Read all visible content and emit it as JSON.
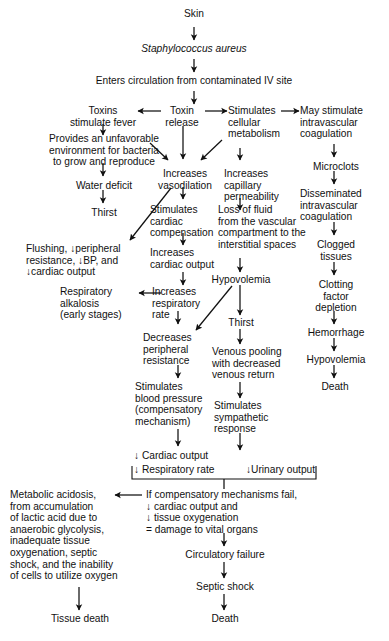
{
  "diagram": {
    "ink_color": "#111111",
    "background_color": "#ffffff",
    "nodes": [
      {
        "id": "skin",
        "text": "Skin"
      },
      {
        "id": "staph",
        "text": "Staphylococcus aureus"
      },
      {
        "id": "enters",
        "text": "Enters circulation from contaminated IV site"
      },
      {
        "id": "toxins_fever",
        "text": "Toxins\nstimulate fever"
      },
      {
        "id": "toxin_release",
        "text": "Toxin\nrelease"
      },
      {
        "id": "stim_cellular",
        "text": "Stimulates\ncellular\nmetabolism"
      },
      {
        "id": "may_stim_ivc",
        "text": "May stimulate\nintravascular\ncoagulation"
      },
      {
        "id": "unfavorable",
        "text": "Provides an unfavorable\nenvironment for bacteria\nto grow and reproduce"
      },
      {
        "id": "increases_vaso",
        "text": "Increases\nvasodilation"
      },
      {
        "id": "increases_cap",
        "text": "Increases\ncapillary\npermeability"
      },
      {
        "id": "microclots",
        "text": "Microclots"
      },
      {
        "id": "water_deficit",
        "text": "Water deficit"
      },
      {
        "id": "stim_cardiac_comp",
        "text": "Stimulates\ncardiac\ncompensation"
      },
      {
        "id": "loss_fluid",
        "text": "Loss of fluid\nfrom the vascular\ncompartment to the\ninterstitial spaces"
      },
      {
        "id": "dic",
        "text": "Disseminated\nintravascular\ncoagulation"
      },
      {
        "id": "thirst1",
        "text": "Thirst"
      },
      {
        "id": "flushing",
        "text": "Flushing, ↓peripheral\nresistance, ↓BP, and\n↓cardiac output"
      },
      {
        "id": "inc_cardiac_out",
        "text": "Increases\ncardiac output"
      },
      {
        "id": "hypovolemia1",
        "text": "Hypovolemia"
      },
      {
        "id": "clogged",
        "text": "Clogged\ntissues"
      },
      {
        "id": "resp_alkalosis",
        "text": "Respiratory\nalkalosis\n(early stages)"
      },
      {
        "id": "inc_resp_rate",
        "text": "Increases\nrespiratory\nrate"
      },
      {
        "id": "thirst2",
        "text": "Thirst"
      },
      {
        "id": "clotting_factor",
        "text": "Clotting\nfactor\ndepletion"
      },
      {
        "id": "dec_periph_res",
        "text": "Decreases\nperipheral\nresistance"
      },
      {
        "id": "venous_pooling",
        "text": "Venous pooling\nwith decreased\nvenous return"
      },
      {
        "id": "hemorrhage",
        "text": "Hemorrhage"
      },
      {
        "id": "stim_bp",
        "text": "Stimulates\nblood pressure\n(compensatory\nmechanism)"
      },
      {
        "id": "stim_symp",
        "text": "Stimulates\nsympathetic\nresponse"
      },
      {
        "id": "hypovolemia2",
        "text": "Hypovolemia"
      },
      {
        "id": "death_right",
        "text": "Death"
      },
      {
        "id": "cardiac_output_dn",
        "text": "↓ Cardiac output"
      },
      {
        "id": "resp_rate_dn",
        "text": "↓ Respiratory rate"
      },
      {
        "id": "urinary_output_dn",
        "text": "↓Urinary output"
      },
      {
        "id": "metabolic_acid",
        "text": "Metabolic acidosis,\nfrom accumulation\nof lactic acid due to\nanaerobic glycolysis,\ninadequate tissue\noxygenation, septic\nshock, and the inability\nof cells to utilize oxygen"
      },
      {
        "id": "comp_fail",
        "text": "If compensatory mechanisms fail,\n  ↓  cardiac output and\n  ↓  tissue oxygenation\n= damage to vital organs"
      },
      {
        "id": "circ_failure",
        "text": "Circulatory failure"
      },
      {
        "id": "tissue_death",
        "text": "Tissue death"
      },
      {
        "id": "septic_shock",
        "text": "Septic shock"
      },
      {
        "id": "death_bottom",
        "text": "Death"
      }
    ],
    "edges": [
      {
        "from": "skin",
        "to": "staph",
        "style": "straight-down"
      },
      {
        "from": "staph",
        "to": "enters",
        "style": "straight-down"
      },
      {
        "from": "enters",
        "to": "toxin_release",
        "style": "straight-down"
      },
      {
        "from": "toxin_release",
        "to": "toxins_fever",
        "style": "left"
      },
      {
        "from": "toxin_release",
        "to": "stim_cellular",
        "style": "right"
      },
      {
        "from": "stim_cellular",
        "to": "may_stim_ivc",
        "style": "right"
      },
      {
        "from": "toxins_fever",
        "to": "unfavorable",
        "style": "straight-down"
      },
      {
        "from": "toxin_release",
        "to": "increases_vaso",
        "style": "straight-down"
      },
      {
        "from": "unfavorable",
        "to": "increases_vaso",
        "style": "diagonal"
      },
      {
        "from": "stim_cellular",
        "to": "increases_vaso",
        "style": "diagonal"
      },
      {
        "from": "stim_cellular",
        "to": "increases_cap",
        "style": "straight-down"
      },
      {
        "from": "may_stim_ivc",
        "to": "microclots",
        "style": "straight-down"
      },
      {
        "from": "unfavorable",
        "to": "water_deficit",
        "style": "straight-down"
      },
      {
        "from": "increases_vaso",
        "to": "stim_cardiac_comp",
        "style": "straight-down"
      },
      {
        "from": "increases_cap",
        "to": "loss_fluid",
        "style": "straight-down"
      },
      {
        "from": "microclots",
        "to": "dic",
        "style": "straight-down"
      },
      {
        "from": "water_deficit",
        "to": "thirst1",
        "style": "straight-down"
      },
      {
        "from": "increases_vaso",
        "to": "flushing",
        "style": "diagonal"
      },
      {
        "from": "stim_cardiac_comp",
        "to": "inc_cardiac_out",
        "style": "straight-down"
      },
      {
        "from": "loss_fluid",
        "to": "hypovolemia1",
        "style": "straight-down"
      },
      {
        "from": "dic",
        "to": "clogged",
        "style": "straight-down"
      },
      {
        "from": "inc_cardiac_out",
        "to": "inc_resp_rate",
        "style": "straight-down"
      },
      {
        "from": "inc_resp_rate",
        "to": "resp_alkalosis",
        "style": "left"
      },
      {
        "from": "hypovolemia1",
        "to": "thirst2",
        "style": "straight-down"
      },
      {
        "from": "clogged",
        "to": "clotting_factor",
        "style": "straight-down"
      },
      {
        "from": "inc_resp_rate",
        "to": "dec_periph_res",
        "style": "straight-down"
      },
      {
        "from": "hypovolemia1",
        "to": "dec_periph_res",
        "style": "diagonal"
      },
      {
        "from": "thirst2",
        "to": "venous_pooling",
        "style": "straight-down"
      },
      {
        "from": "clotting_factor",
        "to": "hemorrhage",
        "style": "straight-down"
      },
      {
        "from": "dec_periph_res",
        "to": "stim_bp",
        "style": "straight-down"
      },
      {
        "from": "venous_pooling",
        "to": "stim_symp",
        "style": "straight-down"
      },
      {
        "from": "hemorrhage",
        "to": "hypovolemia2",
        "style": "straight-down"
      },
      {
        "from": "stim_bp",
        "to": "cardiac_output_dn",
        "style": "straight-down"
      },
      {
        "from": "stim_symp",
        "to": "urinary_output_dn",
        "style": "straight-down"
      },
      {
        "from": "hypovolemia2",
        "to": "death_right",
        "style": "straight-down"
      },
      {
        "from": "bracket",
        "to": "comp_fail",
        "style": "bracket-down"
      },
      {
        "from": "comp_fail",
        "to": "metabolic_acid",
        "style": "left"
      },
      {
        "from": "comp_fail",
        "to": "circ_failure",
        "style": "straight-down"
      },
      {
        "from": "metabolic_acid",
        "to": "tissue_death",
        "style": "straight-down"
      },
      {
        "from": "circ_failure",
        "to": "septic_shock",
        "style": "straight-down"
      },
      {
        "from": "septic_shock",
        "to": "death_bottom",
        "style": "straight-down"
      }
    ]
  }
}
